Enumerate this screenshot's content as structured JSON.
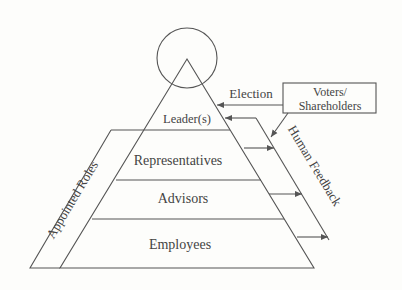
{
  "diagram": {
    "layers": [
      {
        "label": "Leader(s)"
      },
      {
        "label": "Representatives"
      },
      {
        "label": "Advisors"
      },
      {
        "label": "Employees"
      }
    ],
    "side_label": "Appointed Roles",
    "external_box": {
      "line1": "Voters/",
      "line2": "Shareholders"
    },
    "election_label": "Election",
    "feedback_label": "Human Feedback",
    "colors": {
      "line": "#555555",
      "text": "#444444",
      "background": "#fdfdfb"
    }
  }
}
